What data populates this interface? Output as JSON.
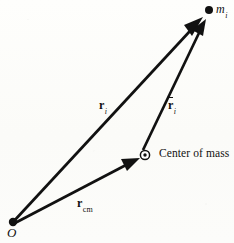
{
  "figure": {
    "background_color": "#fdfdfb",
    "ink_color": "#111111",
    "width": 234,
    "height": 243
  },
  "points": [
    {
      "id": "origin",
      "label": "O",
      "style": "italic-serif",
      "marker": "filled-dot",
      "x": 13,
      "y": 222,
      "label_x": 7,
      "label_y": 226
    },
    {
      "id": "particle",
      "label": "m",
      "subscript": "i",
      "style": "italic-serif",
      "marker": "filled-dot",
      "x": 209,
      "y": 10,
      "label_x": 216,
      "label_y": 3
    },
    {
      "id": "center-of-mass",
      "label": "Center of mass",
      "style": "upright-serif",
      "marker": "circled-dot",
      "x": 145,
      "y": 155,
      "label_x": 159,
      "label_y": 148
    }
  ],
  "vectors": [
    {
      "id": "r-i",
      "symbol": "r",
      "subscript": "i",
      "overbar": false,
      "from": "origin",
      "to": "particle",
      "x1": 14,
      "y1": 221,
      "x2": 203,
      "y2": 17,
      "label_x": 99,
      "label_y": 99,
      "description": "position vector of mass m_i from origin O"
    },
    {
      "id": "r-cm",
      "symbol": "r",
      "subscript": "cm",
      "overbar": false,
      "from": "origin",
      "to": "center-of-mass",
      "x1": 15,
      "y1": 223,
      "x2": 140,
      "y2": 158,
      "label_x": 77,
      "label_y": 197,
      "description": "position vector of the center of mass from origin O"
    },
    {
      "id": "r-bar-i",
      "symbol": "r",
      "subscript": "i",
      "overbar": true,
      "from": "center-of-mass",
      "to": "particle",
      "x1": 143,
      "y1": 150,
      "x2": 206,
      "y2": 19,
      "label_x": 168,
      "label_y": 99,
      "description": "position vector of mass m_i relative to the center of mass"
    }
  ],
  "markers": {
    "filled_dot_radius": 4,
    "center_of_mass_outer_radius": 4.5,
    "center_of_mass_inner_radius": 1.6,
    "arrowhead_length": 17,
    "arrowhead_half_width": 5.5,
    "stroke_width": 2.6
  }
}
